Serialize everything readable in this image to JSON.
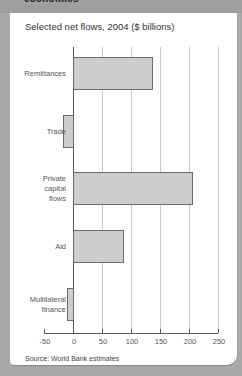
{
  "header": {
    "title": "economies"
  },
  "chart_data": {
    "type": "bar",
    "orientation": "horizontal",
    "title": "Selected net flows, 2004 ($ billions)",
    "categories": [
      "Remittances",
      "Trade",
      "Private capital flows",
      "Aid",
      "Multilateral finance"
    ],
    "category_labels": [
      "Remittances",
      "Trade",
      "Private\ncapital\nflows",
      "Aid",
      "Multilateral\nfinance"
    ],
    "values": [
      136,
      -17,
      205,
      86,
      -10
    ],
    "xlabel": "",
    "ylabel": "",
    "xlim": [
      -50,
      250
    ],
    "xticks": [
      -50,
      0,
      50,
      100,
      150,
      200,
      250
    ],
    "xtick_labels": [
      "-50",
      "0",
      "50",
      "100",
      "150",
      "200",
      "250"
    ],
    "grid": true,
    "legend": null,
    "bar_color": "#cdcdcd",
    "bar_edge_color": "#6b6b6b"
  },
  "source": "Source: World Bank estimates"
}
